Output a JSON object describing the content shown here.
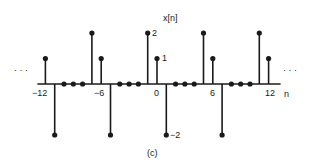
{
  "figure": {
    "caption": "(c)",
    "signal_label": "x[n]",
    "axis_variable": "n",
    "left_ellipsis": "· · ·",
    "right_ellipsis": "· · ·"
  },
  "chart_data": {
    "type": "stem",
    "title": "x[n]",
    "xlabel": "n",
    "ylabel": "x[n]",
    "period": 6,
    "x": [
      -12,
      -11,
      -10,
      -9,
      -8,
      -7,
      -6,
      -5,
      -4,
      -3,
      -2,
      -1,
      0,
      1,
      2,
      3,
      4,
      5,
      6,
      7,
      8,
      9,
      10,
      11,
      12
    ],
    "values": [
      1,
      -2,
      0,
      0,
      0,
      2,
      1,
      -2,
      0,
      0,
      0,
      2,
      1,
      -2,
      0,
      0,
      0,
      2,
      1,
      -2,
      0,
      0,
      0,
      2,
      1
    ],
    "x_tick_labels": [
      "-12",
      "-6",
      "0",
      "6",
      "12"
    ],
    "value_annotations": [
      {
        "n": -1,
        "label": "2"
      },
      {
        "n": 0,
        "label": "1"
      },
      {
        "n": 1,
        "label": "-2"
      }
    ],
    "continues_both_directions": true
  },
  "layout": {
    "origin_x": 157,
    "axis_y": 84,
    "px_per_n": 9.3,
    "px_per_unit": 25.5,
    "ink_color": "#1a1a1a"
  },
  "labels": {
    "tick_m12": "−12",
    "tick_m6": "−6",
    "tick_0": "0",
    "tick_6": "6",
    "tick_12": "12",
    "val_2": "2",
    "val_1": "1",
    "val_m2": "−2"
  }
}
